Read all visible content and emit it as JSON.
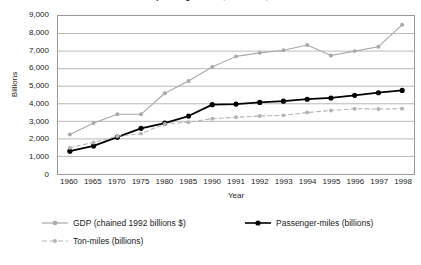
{
  "chart_data": {
    "type": "line",
    "title": "Growth in passenger-miles, ton-miles, and GDP",
    "xlabel": "Year",
    "ylabel": "Billions",
    "ylim": [
      0,
      9000
    ],
    "ytick_step": 1000,
    "grid": true,
    "legend_position": "bottom",
    "categories": [
      "1960",
      "1965",
      "1970",
      "1975",
      "1980",
      "1985",
      "1990",
      "1991",
      "1992",
      "1993",
      "1994",
      "1995",
      "1996",
      "1997",
      "1998"
    ],
    "ytick_labels": [
      "9,000",
      "8,000",
      "7,000",
      "6,000",
      "5,000",
      "4,000",
      "3,000",
      "2,000",
      "1,000",
      "0"
    ],
    "ytick_values": [
      9000,
      8000,
      7000,
      6000,
      5000,
      4000,
      3000,
      2000,
      1000,
      0
    ],
    "series": [
      {
        "name": "GDP (chained 1992 billions $)",
        "color": "#a8a8a8",
        "style": "solid",
        "marker": "circle",
        "values": [
          2250,
          2900,
          3400,
          3400,
          4600,
          5300,
          6100,
          6700,
          6900,
          7050,
          7350,
          6750,
          7000,
          7250,
          8500
        ]
      },
      {
        "name": "Passenger-miles (billions)",
        "color": "#000000",
        "style": "solid",
        "marker": "circle",
        "values": [
          1300,
          1600,
          2100,
          2600,
          2900,
          3300,
          3950,
          3980,
          4080,
          4150,
          4260,
          4330,
          4480,
          4630,
          4760
        ]
      },
      {
        "name": "Ton-miles (billions)",
        "color": "#b4b4b4",
        "style": "dashed",
        "marker": "circle",
        "values": [
          1500,
          1800,
          2150,
          2300,
          2850,
          2950,
          3150,
          3230,
          3300,
          3340,
          3500,
          3620,
          3720,
          3700,
          3720
        ]
      }
    ]
  },
  "legend": {
    "items": [
      {
        "label": "GDP (chained 1992 billions $)"
      },
      {
        "label": "Passenger-miles (billions)"
      },
      {
        "label": "Ton-miles (billions)"
      }
    ]
  }
}
